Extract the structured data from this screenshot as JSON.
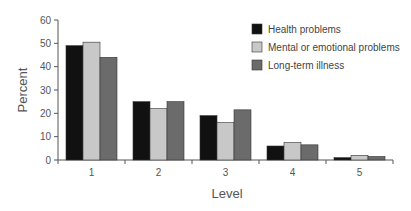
{
  "chart_data": {
    "type": "bar",
    "title": "",
    "xlabel": "Level",
    "ylabel": "Percent",
    "ylim": [
      0,
      60
    ],
    "yticks": [
      0,
      10,
      20,
      30,
      40,
      50,
      60
    ],
    "grid": false,
    "legend_position": "top-right",
    "categories": [
      "1",
      "2",
      "3",
      "4",
      "5"
    ],
    "series": [
      {
        "name": "Health problems",
        "color": "#111111",
        "values": [
          49,
          25,
          19,
          6,
          1
        ]
      },
      {
        "name": "Mental or emotional problems",
        "color": "#c8c8c8",
        "values": [
          50.5,
          22,
          16,
          7.5,
          2
        ]
      },
      {
        "name": "Long-term illness",
        "color": "#6b6b6b",
        "values": [
          44,
          25,
          21.5,
          6.5,
          1.5
        ]
      }
    ]
  }
}
